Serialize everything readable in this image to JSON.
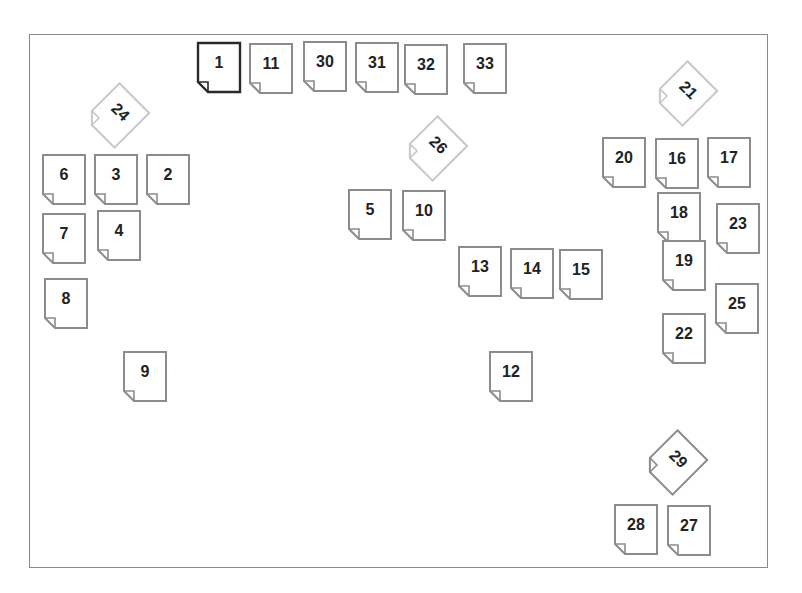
{
  "diagram": {
    "type": "page-sorter",
    "frame": {
      "left": 29,
      "top": 34,
      "width": 739,
      "height": 534
    },
    "colors": {
      "normal_border": "#8c8c8c",
      "selected_border": "#2a2a2a",
      "faded_border": "#c8c8c8",
      "text": "#222222",
      "background": "#ffffff"
    },
    "pages": [
      {
        "label": "1",
        "x": 197,
        "y": 42,
        "state": "selected",
        "rotation": 0
      },
      {
        "label": "11",
        "x": 249,
        "y": 43,
        "state": "normal",
        "rotation": 0
      },
      {
        "label": "30",
        "x": 303,
        "y": 41,
        "state": "normal",
        "rotation": 0
      },
      {
        "label": "31",
        "x": 355,
        "y": 42,
        "state": "normal",
        "rotation": 0
      },
      {
        "label": "32",
        "x": 404,
        "y": 44,
        "state": "normal",
        "rotation": 0
      },
      {
        "label": "33",
        "x": 463,
        "y": 43,
        "state": "normal",
        "rotation": 0
      },
      {
        "label": "24",
        "x": 95,
        "y": 90,
        "state": "faded",
        "rotation": 45
      },
      {
        "label": "26",
        "x": 413,
        "y": 123,
        "state": "faded",
        "rotation": 45
      },
      {
        "label": "21",
        "x": 663,
        "y": 68,
        "state": "faded",
        "rotation": 45
      },
      {
        "label": "6",
        "x": 42,
        "y": 154,
        "state": "normal",
        "rotation": 0
      },
      {
        "label": "3",
        "x": 94,
        "y": 154,
        "state": "normal",
        "rotation": 0
      },
      {
        "label": "2",
        "x": 146,
        "y": 154,
        "state": "normal",
        "rotation": 0
      },
      {
        "label": "7",
        "x": 42,
        "y": 213,
        "state": "normal",
        "rotation": 0
      },
      {
        "label": "4",
        "x": 97,
        "y": 210,
        "state": "normal",
        "rotation": 0
      },
      {
        "label": "8",
        "x": 44,
        "y": 278,
        "state": "normal",
        "rotation": 0
      },
      {
        "label": "9",
        "x": 123,
        "y": 351,
        "state": "normal",
        "rotation": 0
      },
      {
        "label": "5",
        "x": 348,
        "y": 189,
        "state": "normal",
        "rotation": 0
      },
      {
        "label": "10",
        "x": 402,
        "y": 190,
        "state": "normal",
        "rotation": 0
      },
      {
        "label": "13",
        "x": 458,
        "y": 246,
        "state": "normal",
        "rotation": 0
      },
      {
        "label": "14",
        "x": 510,
        "y": 248,
        "state": "normal",
        "rotation": 0
      },
      {
        "label": "15",
        "x": 559,
        "y": 249,
        "state": "normal",
        "rotation": 0
      },
      {
        "label": "12",
        "x": 489,
        "y": 351,
        "state": "normal",
        "rotation": 0
      },
      {
        "label": "20",
        "x": 602,
        "y": 137,
        "state": "normal",
        "rotation": 0
      },
      {
        "label": "16",
        "x": 655,
        "y": 138,
        "state": "normal",
        "rotation": 0
      },
      {
        "label": "17",
        "x": 707,
        "y": 137,
        "state": "normal",
        "rotation": 0
      },
      {
        "label": "18",
        "x": 657,
        "y": 192,
        "state": "normal",
        "rotation": 0
      },
      {
        "label": "19",
        "x": 662,
        "y": 240,
        "state": "normal",
        "rotation": 0
      },
      {
        "label": "23",
        "x": 716,
        "y": 203,
        "state": "normal",
        "rotation": 0
      },
      {
        "label": "25",
        "x": 715,
        "y": 283,
        "state": "normal",
        "rotation": 0
      },
      {
        "label": "22",
        "x": 662,
        "y": 313,
        "state": "normal",
        "rotation": 0
      },
      {
        "label": "29",
        "x": 653,
        "y": 437,
        "state": "normal",
        "rotation": 45
      },
      {
        "label": "28",
        "x": 614,
        "y": 504,
        "state": "normal",
        "rotation": 0
      },
      {
        "label": "27",
        "x": 667,
        "y": 505,
        "state": "normal",
        "rotation": 0
      }
    ]
  }
}
